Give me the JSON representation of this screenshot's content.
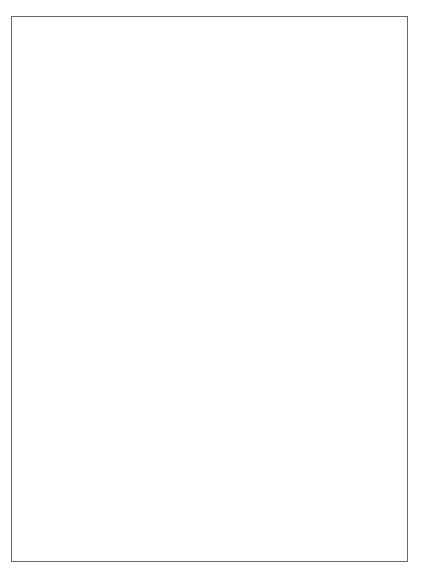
{
  "wheel": {
    "center": [
      212,
      211
    ],
    "zodiac_signs": [
      {
        "name": "aries",
        "glyph": "♈",
        "angle": 90
      },
      {
        "name": "pisces",
        "glyph": "♓",
        "angle": 60
      },
      {
        "name": "aquarius",
        "glyph": "♒",
        "angle": 30
      },
      {
        "name": "capricorn",
        "glyph": "♑",
        "angle": 0
      },
      {
        "name": "sagittarius",
        "glyph": "♐",
        "angle": -30
      },
      {
        "name": "scorpio",
        "glyph": "♏",
        "angle": -60
      },
      {
        "name": "libra",
        "glyph": "♎",
        "angle": -90
      },
      {
        "name": "virgo",
        "glyph": "♍",
        "angle": -120
      },
      {
        "name": "leo",
        "glyph": "♌",
        "angle": -150
      },
      {
        "name": "cancer",
        "glyph": "♋",
        "angle": 180
      },
      {
        "name": "gemini",
        "glyph": "♊",
        "angle": 150
      },
      {
        "name": "taurus",
        "glyph": "♉",
        "angle": 120
      }
    ],
    "planets": [
      {
        "name": "mars",
        "glyph": "♂",
        "x": 163,
        "y": 107
      },
      {
        "name": "chiron",
        "glyph": "⚷",
        "x": 176,
        "y": 103
      },
      {
        "name": "venus",
        "glyph": "♀",
        "x": 190,
        "y": 98,
        "retro": "R"
      },
      {
        "name": "mercury",
        "glyph": "☿",
        "x": 204,
        "y": 99
      },
      {
        "name": "sun",
        "glyph": "☉",
        "x": 241,
        "y": 103
      },
      {
        "name": "mc",
        "glyph": "MC",
        "x": 275,
        "y": 115
      },
      {
        "name": "north-node",
        "glyph": "☊",
        "x": 131,
        "y": 125,
        "retro": "R"
      },
      {
        "name": "lilith",
        "glyph": "⚸",
        "x": 113,
        "y": 146
      },
      {
        "name": "jupiter",
        "glyph": "♃",
        "x": 314,
        "y": 157
      },
      {
        "name": "moon",
        "glyph": "☽",
        "x": 326,
        "y": 197
      },
      {
        "name": "dc",
        "glyph": "DC",
        "x": 326,
        "y": 211
      },
      {
        "name": "neptune",
        "glyph": "♆",
        "x": 326,
        "y": 225
      },
      {
        "name": "uranus",
        "glyph": "♅",
        "x": 318,
        "y": 252
      },
      {
        "name": "saturn",
        "glyph": "♄",
        "x": 298,
        "y": 289,
        "retro": "R"
      },
      {
        "name": "south-node",
        "glyph": "☋",
        "x": 284,
        "y": 297,
        "retro": "R"
      },
      {
        "name": "pluto",
        "glyph": "♇",
        "x": 258,
        "y": 311,
        "retro": "R"
      },
      {
        "name": "ac",
        "glyph": "AC",
        "x": 92,
        "y": 211
      }
    ],
    "house_numbers": [
      "1",
      "2",
      "3",
      "4",
      "5",
      "6",
      "7",
      "8",
      "9",
      "10",
      "11",
      "12"
    ]
  },
  "positions": [
    {
      "symbol": "AC",
      "value": "9°33'15\"♋"
    },
    {
      "symbol": "DC",
      "value": "9°33'15\"♑"
    },
    {
      "symbol": "MC",
      "value": "6°13'27\"♓"
    },
    {
      "symbol": "☉",
      "value": "24°48'29\"♓"
    },
    {
      "symbol": "☽",
      "value": "15°58'09\"♑"
    },
    {
      "symbol": "☿",
      "value": "12°59'23\"♈"
    },
    {
      "symbol": "♀",
      "value": "22°14'15\"♈ r"
    },
    {
      "symbol": "♂",
      "value": "0°10'42\"♉"
    },
    {
      "symbol": "♃",
      "value": "7°54'53\"♒"
    },
    {
      "symbol": "♄",
      "value": "28°04'23\"♏ r"
    },
    {
      "symbol": "♅",
      "value": "17°57'39\"♐ sd"
    },
    {
      "symbol": "♆",
      "value": "3°29'54\"♑"
    },
    {
      "symbol": "♇",
      "value": "4°21'16\"♏ r"
    },
    {
      "symbol": "☊",
      "value": "19°56'00\"♉ r"
    },
    {
      "symbol": "☋",
      "value": "19°56'00\"♏ r"
    },
    {
      "symbol": "⚷",
      "value": "3°54'54\"♊"
    },
    {
      "symbol": "⚸",
      "value": "26°02'54\"♈"
    }
  ],
  "elements": [
    "Feuer: 7",
    "Erde: 9",
    "Luft: 2",
    "Wasser: 16",
    "Kardinal: 16",
    "Fest: 8",
    "Veränderlich: 10"
  ],
  "aspect_grid": {
    "row_labels": [
      "DC",
      "MC",
      "☉",
      "☽",
      "☿",
      "♀",
      "♂",
      "♃",
      "♄",
      "♅",
      "♆",
      "♇",
      "☊",
      "☋",
      "⚷",
      "⚸"
    ],
    "col_labels": [
      "⚸",
      "☋",
      "☊",
      "♇",
      "♆",
      "♅",
      "♄",
      "♃",
      "♂",
      "♀",
      "☿",
      "☽",
      "☉",
      "MC",
      "DC",
      "AC"
    ],
    "aspects": [
      {
        "row": 1,
        "col": 15,
        "glyph": "△",
        "orb": "3°19'"
      },
      {
        "row": 4,
        "col": 11,
        "glyph": "□",
        "orb": "3°00'"
      },
      {
        "row": 4,
        "col": 15,
        "glyph": "□",
        "orb": "3°05'"
      },
      {
        "row": 8,
        "col": 9,
        "glyph": "△",
        "orb": "5°49'"
      },
      {
        "row": 9,
        "col": 13,
        "glyph": "⚹",
        "orb": "2°07'"
      },
      {
        "row": 10,
        "col": 13,
        "glyph": "△",
        "orb": "5°56'"
      },
      {
        "row": 9,
        "col": 6,
        "glyph": "⚹",
        "orb": "2°33'"
      },
      {
        "row": 9,
        "col": 9,
        "glyph": "□",
        "orb": "3°44'"
      },
      {
        "row": 11,
        "col": 11,
        "glyph": "△",
        "orb": "4°43'"
      },
      {
        "row": 12,
        "col": 11,
        "glyph": "⚹",
        "orb": "4°27'"
      },
      {
        "row": 11,
        "col": 3,
        "glyph": "☍",
        "orb": "4°50'"
      },
      {
        "row": 13,
        "col": 9,
        "glyph": "△",
        "orb": "4°59'"
      },
      {
        "row": 13,
        "col": 14,
        "glyph": "□",
        "orb": "4°36'"
      },
      {
        "row": 14,
        "col": 9,
        "glyph": "☌",
        "orb": "0°10'"
      },
      {
        "row": 14,
        "col": 10,
        "glyph": "☌",
        "orb": "1°06'"
      }
    ]
  }
}
